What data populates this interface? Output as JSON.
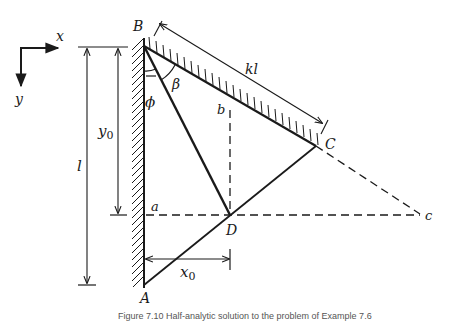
{
  "figure": {
    "caption": "Figure 7.10  Half-analytic solution to the problem of Example 7.6",
    "axes": {
      "x_label": "x",
      "y_label": "y"
    },
    "points": {
      "A": "A",
      "B": "B",
      "C": "C",
      "D": "D",
      "a": "a",
      "b": "b",
      "c": "c"
    },
    "angles": {
      "phi": "ϕ",
      "beta": "β"
    },
    "dimensions": {
      "l": "l",
      "y0": "y",
      "y0_sub": "0",
      "x0": "x",
      "x0_sub": "0",
      "kl": "kl"
    }
  }
}
